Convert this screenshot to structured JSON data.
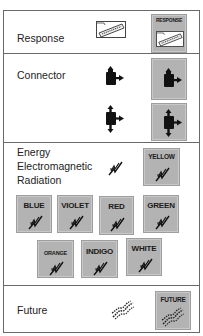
{
  "sections": [
    {
      "id": "response",
      "label": "Response",
      "icon": "response-envelope-icon",
      "tiles": [
        {
          "caption": "RESPONSE",
          "icon": "response-envelope-icon"
        }
      ]
    },
    {
      "id": "connector",
      "label": "Connector",
      "icons": [
        "connector-right-icon",
        "connector-up-down-right-icon"
      ],
      "tiles": [
        {
          "caption": "",
          "icon": "connector-right-icon"
        },
        {
          "caption": "",
          "icon": "connector-up-down-right-icon"
        }
      ]
    },
    {
      "id": "energy",
      "label_lines": [
        "Energy",
        "Electromagnetic",
        "Radiation"
      ],
      "icon": "wave-zigzag-icon",
      "tiles": [
        {
          "caption": "YELLOW",
          "icon": "wave-zigzag-icon"
        },
        {
          "caption": "BLUE",
          "icon": "wave-zigzag-icon"
        },
        {
          "caption": "VIOLET",
          "icon": "wave-zigzag-icon"
        },
        {
          "caption": "RED",
          "icon": "wave-zigzag-icon"
        },
        {
          "caption": "GREEN",
          "icon": "wave-zigzag-icon"
        },
        {
          "caption": "ORANGE",
          "icon": "wave-zigzag-icon"
        },
        {
          "caption": "INDIGO",
          "icon": "wave-zigzag-icon"
        },
        {
          "caption": "WHITE",
          "icon": "wave-zigzag-icon"
        }
      ]
    },
    {
      "id": "future",
      "label": "Future",
      "icon": "future-wave-icon",
      "tiles": [
        {
          "caption": "FUTURE",
          "icon": "future-wave-icon"
        }
      ]
    }
  ],
  "colors": {
    "tile_bg": "#b3b3b3",
    "border": "#6a6a6a",
    "text": "#222222"
  }
}
